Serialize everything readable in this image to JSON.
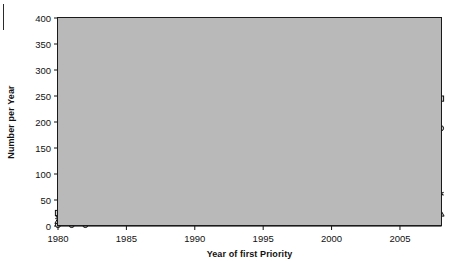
{
  "chart_data": {
    "type": "line",
    "title": "",
    "xlabel": "Year of first Priority",
    "ylabel": "Number per Year",
    "xlim": [
      1980,
      2008
    ],
    "ylim": [
      0,
      400
    ],
    "ytick_step": 50,
    "yticks": [
      0,
      50,
      100,
      150,
      200,
      250,
      300,
      350,
      400
    ],
    "xticks": [
      1980,
      1985,
      1990,
      1995,
      2000,
      2005
    ],
    "grid": "horizontal",
    "plot_background": "#b9b9b9",
    "legend_position": "upper-left-inside",
    "x": [
      1980,
      1981,
      1982,
      1983,
      1984,
      1985,
      1986,
      1987,
      1988,
      1989,
      1990,
      1991,
      1992,
      1993,
      1994,
      1995,
      1996,
      1997,
      1998,
      1999,
      2000,
      2001,
      2002,
      2003,
      2004,
      2005,
      2006,
      2007,
      2008
    ],
    "series": [
      {
        "name": "Total",
        "marker": "square",
        "linestyle": "solid",
        "color": "#1a1a1a",
        "values": [
          25,
          41,
          40,
          53,
          75,
          90,
          87,
          92,
          95,
          112,
          117,
          95,
          129,
          121,
          118,
          131,
          139,
          120,
          152,
          213,
          196,
          247,
          302,
          383,
          345,
          293,
          291,
          300,
          245
        ]
      },
      {
        "name": "Asia",
        "marker": "circle",
        "linestyle": "solid",
        "color": "#1a1a1a",
        "values": [
          2,
          2,
          2,
          22,
          25,
          51,
          35,
          50,
          47,
          46,
          53,
          53,
          40,
          45,
          47,
          44,
          42,
          40,
          45,
          58,
          78,
          128,
          175,
          190,
          151,
          180,
          196,
          190,
          188
        ]
      },
      {
        "name": "America",
        "marker": "asterisk",
        "linestyle": "dashed",
        "color": "#1a1a1a",
        "values": [
          17,
          26,
          24,
          25,
          26,
          24,
          20,
          22,
          25,
          23,
          29,
          30,
          33,
          44,
          46,
          44,
          49,
          38,
          49,
          51,
          60,
          65,
          86,
          120,
          107,
          95,
          85,
          75,
          62
        ]
      },
      {
        "name": "Europe",
        "marker": "triangle",
        "linestyle": "solid",
        "color": "#1a1a1a",
        "values": [
          10,
          25,
          8,
          22,
          25,
          28,
          26,
          30,
          28,
          31,
          34,
          21,
          18,
          39,
          47,
          40,
          38,
          38,
          35,
          40,
          37,
          53,
          46,
          62,
          40,
          33,
          30,
          28,
          24
        ]
      }
    ]
  },
  "legend": {
    "items": [
      {
        "label": "Total",
        "marker": "square",
        "linestyle": "solid"
      },
      {
        "label": "Asia",
        "marker": "circle",
        "linestyle": "solid"
      },
      {
        "label": "America",
        "marker": "asterisk",
        "linestyle": "dashed"
      },
      {
        "label": "Europe",
        "marker": "triangle",
        "linestyle": "solid"
      }
    ]
  }
}
